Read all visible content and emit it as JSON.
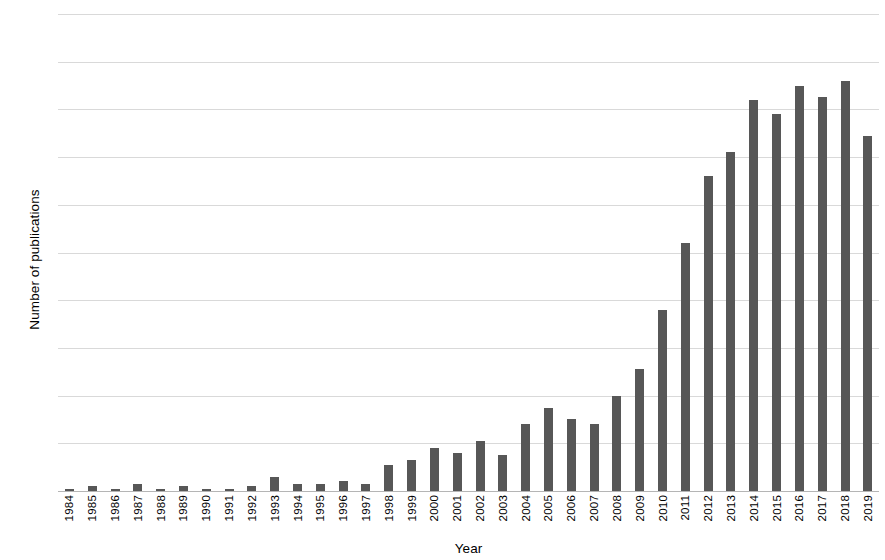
{
  "chart_data": {
    "type": "bar",
    "title": "",
    "xlabel": "Year",
    "ylabel": "Number of publications",
    "ylim": [
      0,
      200
    ],
    "yticks": [
      0,
      20,
      40,
      60,
      80,
      100,
      120,
      140,
      160,
      180,
      200
    ],
    "grid": true,
    "legend": null,
    "bar_color": "#575757",
    "categories": [
      "1984",
      "1985",
      "1986",
      "1987",
      "1988",
      "1989",
      "1990",
      "1991",
      "1992",
      "1993",
      "1994",
      "1995",
      "1996",
      "1997",
      "1998",
      "1999",
      "2000",
      "2001",
      "2002",
      "2003",
      "2004",
      "2005",
      "2006",
      "2007",
      "2008",
      "2009",
      "2010",
      "2011",
      "2012",
      "2013",
      "2014",
      "2015",
      "2016",
      "2017",
      "2018",
      "2019"
    ],
    "values": [
      1,
      2,
      1,
      3,
      1,
      2,
      1,
      1,
      2,
      6,
      3,
      3,
      4,
      3,
      11,
      13,
      18,
      16,
      21,
      15,
      28,
      35,
      30,
      28,
      40,
      51,
      76,
      104,
      132,
      142,
      164,
      158,
      170,
      165,
      172,
      149
    ]
  }
}
